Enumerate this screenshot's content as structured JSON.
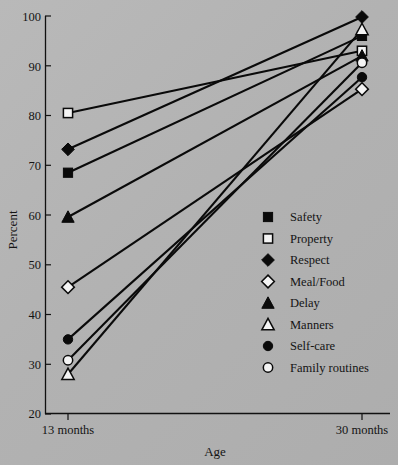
{
  "chart_data": {
    "type": "line",
    "title": "",
    "xlabel": "Age",
    "ylabel": "Percent",
    "categories": [
      "13 months",
      "30 months"
    ],
    "x_tick_labels": [
      "13 months",
      "30 months"
    ],
    "y_tick_labels": [
      "20",
      "30",
      "40",
      "50",
      "60",
      "70",
      "80",
      "90",
      "100"
    ],
    "y_ticks": [
      20,
      30,
      40,
      50,
      60,
      70,
      80,
      90,
      100
    ],
    "ylim": [
      20,
      100
    ],
    "grid": false,
    "legend_position": "center-right",
    "series": [
      {
        "name": "Safety",
        "marker": "filled-square",
        "values": [
          68.5,
          96.0
        ]
      },
      {
        "name": "Property",
        "marker": "open-square",
        "values": [
          80.5,
          93.0
        ]
      },
      {
        "name": "Respect",
        "marker": "filled-diamond",
        "values": [
          73.2,
          99.8
        ]
      },
      {
        "name": "Meal/Food",
        "marker": "open-diamond",
        "values": [
          45.5,
          85.3
        ]
      },
      {
        "name": "Delay",
        "marker": "filled-triangle",
        "values": [
          59.6,
          92.0
        ]
      },
      {
        "name": "Manners",
        "marker": "open-triangle",
        "values": [
          28.0,
          97.3
        ]
      },
      {
        "name": "Self-care",
        "marker": "filled-circle",
        "values": [
          35.0,
          87.7
        ]
      },
      {
        "name": "Family routines",
        "marker": "open-circle",
        "values": [
          30.8,
          90.6
        ]
      }
    ]
  },
  "axes": {
    "y_label": "Percent",
    "x_label": "Age",
    "y_tick_100": "100",
    "y_tick_90": "90",
    "y_tick_80": "80",
    "y_tick_70": "70",
    "y_tick_60": "60",
    "y_tick_50": "50",
    "y_tick_40": "40",
    "y_tick_30": "30",
    "y_tick_20": "20",
    "x_tick_left": "13 months",
    "x_tick_right": "30 months"
  },
  "legend": {
    "items": [
      {
        "label": "Safety",
        "marker": "filled-square"
      },
      {
        "label": "Property",
        "marker": "open-square"
      },
      {
        "label": "Respect",
        "marker": "filled-diamond"
      },
      {
        "label": "Meal/Food",
        "marker": "open-diamond"
      },
      {
        "label": "Delay",
        "marker": "filled-triangle"
      },
      {
        "label": "Manners",
        "marker": "open-triangle"
      },
      {
        "label": "Self-care",
        "marker": "filled-circle"
      },
      {
        "label": "Family routines",
        "marker": "open-circle"
      }
    ]
  },
  "colors": {
    "background": "#b4b4b4",
    "ink": "#0a0a0a",
    "marker_open_fill": "#f4f4f4"
  }
}
